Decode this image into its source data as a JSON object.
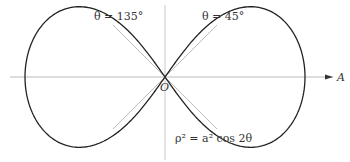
{
  "diagram": {
    "labels": {
      "tangent_left": "θ = 135°",
      "tangent_right": "θ = 45°",
      "origin": "O",
      "axis": "A",
      "equation": "ρ² = a² cos 2θ"
    },
    "curve": {
      "type": "lemniscate",
      "equation": "rho^2 = a^2 cos 2theta"
    },
    "colors": {
      "curve": "#222222",
      "axes": "#aaaaaa",
      "tangents": "#aaaaaa"
    }
  }
}
